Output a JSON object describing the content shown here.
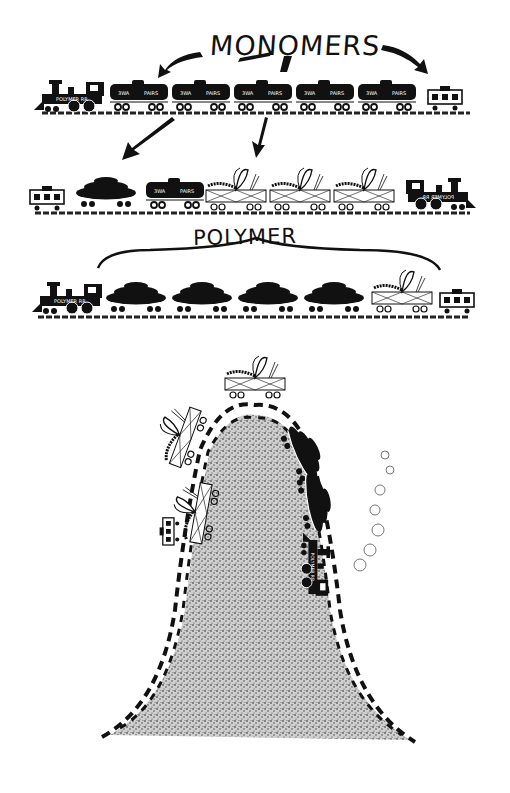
{
  "figure": {
    "title_top": "MONOMERS",
    "title_middle": "POLYMER",
    "locomotive_sign": "POLYMER RR",
    "tank_car_text_left": "3WA",
    "tank_car_text_right": "PAIRS",
    "stacked_car_label": "Ps",
    "rows": [
      {
        "name": "monomers-train",
        "cars": [
          "locomotive",
          "tank",
          "tank",
          "tank",
          "tank",
          "tank",
          "caboose"
        ]
      },
      {
        "name": "mixed-train",
        "cars": [
          "caboose",
          "stacked",
          "tank",
          "butterfly-flatcar",
          "butterfly-flatcar",
          "butterfly-flatcar",
          "locomotive"
        ]
      },
      {
        "name": "polymer-train",
        "cars": [
          "locomotive",
          "stacked",
          "stacked",
          "stacked",
          "stacked",
          "butterfly-flatcar",
          "caboose"
        ]
      }
    ],
    "mountain": {
      "description": "train climbing a speckled mountain on a dashed track"
    }
  }
}
